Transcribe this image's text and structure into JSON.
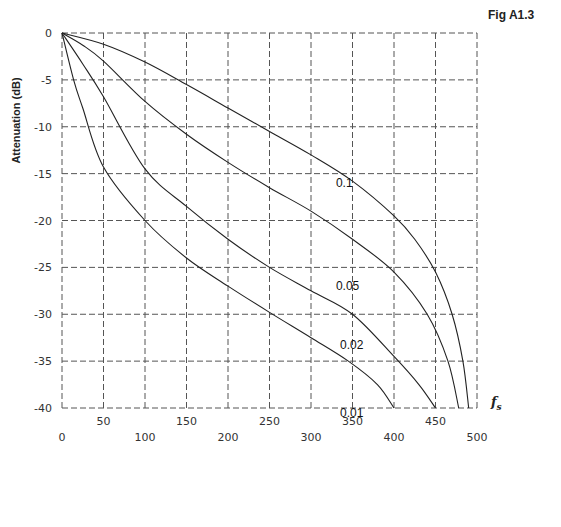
{
  "figure_label": "Fig A1.3",
  "chart_data": {
    "type": "line",
    "title": "",
    "xlabel": "f_s",
    "xlabel_main": "f",
    "xlabel_sub": "s",
    "ylabel": "Attenuation (dB)",
    "xlim": [
      0,
      500
    ],
    "ylim": [
      -40,
      0
    ],
    "grid": true,
    "x_ticks_lower": [
      0,
      100,
      200,
      300,
      400,
      500
    ],
    "x_ticks_upper": [
      50,
      150,
      250,
      350,
      450
    ],
    "x_gridlines": [
      0,
      50,
      100,
      150,
      200,
      250,
      300,
      350,
      400,
      450,
      500
    ],
    "y_ticks": [
      0,
      -5,
      -10,
      -15,
      -20,
      -25,
      -30,
      -35,
      -40
    ],
    "series": [
      {
        "name": "0.1",
        "label_at": [
          330,
          -16
        ],
        "points": [
          [
            0,
            0
          ],
          [
            50,
            -1.2
          ],
          [
            100,
            -3.1
          ],
          [
            150,
            -5.5
          ],
          [
            200,
            -8
          ],
          [
            250,
            -10.5
          ],
          [
            300,
            -13
          ],
          [
            350,
            -15.8
          ],
          [
            400,
            -19.5
          ],
          [
            425,
            -22
          ],
          [
            450,
            -25.5
          ],
          [
            470,
            -30
          ],
          [
            483,
            -35
          ],
          [
            490,
            -40
          ]
        ]
      },
      {
        "name": "0.05",
        "label_at": [
          330,
          -27
        ],
        "points": [
          [
            0,
            0
          ],
          [
            25,
            -1.3
          ],
          [
            50,
            -3
          ],
          [
            100,
            -7.3
          ],
          [
            150,
            -10.8
          ],
          [
            200,
            -13.8
          ],
          [
            250,
            -16.5
          ],
          [
            300,
            -19
          ],
          [
            350,
            -22
          ],
          [
            400,
            -25.5
          ],
          [
            440,
            -30
          ],
          [
            465,
            -35
          ],
          [
            478,
            -40
          ]
        ]
      },
      {
        "name": "0.02",
        "label_at": [
          335,
          -33.3
        ],
        "points": [
          [
            0,
            0
          ],
          [
            25,
            -3.3
          ],
          [
            50,
            -6.8
          ],
          [
            100,
            -14.5
          ],
          [
            150,
            -18.5
          ],
          [
            200,
            -22
          ],
          [
            250,
            -25
          ],
          [
            300,
            -27.5
          ],
          [
            350,
            -30
          ],
          [
            400,
            -34.5
          ],
          [
            430,
            -37.5
          ],
          [
            450,
            -40
          ]
        ]
      },
      {
        "name": "0.01",
        "label_at": [
          335,
          -40.5
        ],
        "points": [
          [
            0,
            0
          ],
          [
            14,
            -5
          ],
          [
            25,
            -8
          ],
          [
            50,
            -14.3
          ],
          [
            100,
            -20
          ],
          [
            150,
            -24
          ],
          [
            200,
            -27
          ],
          [
            250,
            -29.8
          ],
          [
            300,
            -32.5
          ],
          [
            345,
            -35
          ],
          [
            380,
            -37.5
          ],
          [
            400,
            -40
          ]
        ]
      }
    ]
  }
}
